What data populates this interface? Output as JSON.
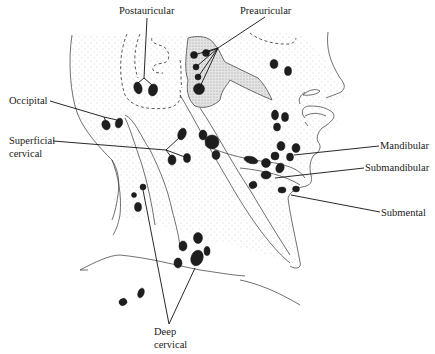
{
  "figure": {
    "type": "anatomical-illustration",
    "labels": [
      {
        "id": "postauricular",
        "text": "Postauricular"
      },
      {
        "id": "preauricular",
        "text": "Preauricular"
      },
      {
        "id": "occipital",
        "text": "Occipital"
      },
      {
        "id": "superficial_cervical_line1",
        "text": "Superficial"
      },
      {
        "id": "superficial_cervical_line2",
        "text": "cervical"
      },
      {
        "id": "mandibular",
        "text": "Mandibular"
      },
      {
        "id": "submandibular",
        "text": "Submandibular"
      },
      {
        "id": "submental",
        "text": "Submental"
      },
      {
        "id": "deep_cervical_line1",
        "text": "Deep"
      },
      {
        "id": "deep_cervical_line2",
        "text": "cervical"
      }
    ],
    "colors": {
      "line": "#333333",
      "node": "#1e1e1e",
      "stipple": "#9a9a9a",
      "text": "#1a1a1a",
      "background": "#ffffff"
    }
  },
  "labels": {
    "postauricular": "Postauricular",
    "preauricular": "Preauricular",
    "occipital": "Occipital",
    "superficial_1": "Superficial",
    "superficial_2": "cervical",
    "mandibular": "Mandibular",
    "submandibular": "Submandibular",
    "submental": "Submental",
    "deep_1": "Deep",
    "deep_2": "cervical"
  }
}
